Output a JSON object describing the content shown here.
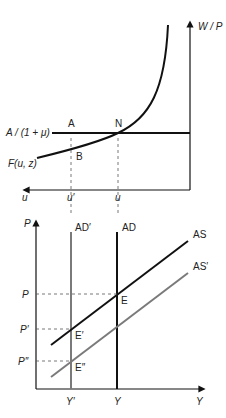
{
  "top_panel": {
    "y_axis_label": "W / P",
    "x_axis_label": "u",
    "price_setting_label": "A / (1 + μ)",
    "wage_setting_label": "F(u, z)",
    "points": {
      "A": "A",
      "N": "N",
      "B": "B"
    },
    "x_ticks": [
      "u′",
      "u"
    ]
  },
  "bottom_panel": {
    "y_axis_label": "P",
    "x_axis_label": "Y",
    "curves": {
      "ad_prime": "AD′",
      "ad": "AD",
      "as": "AS",
      "as_prime": "AS′"
    },
    "points": {
      "E": "E",
      "E_prime": "E′",
      "E_dprime": "E″"
    },
    "y_ticks": [
      "P",
      "P′",
      "P″"
    ],
    "x_ticks": [
      "Y′",
      "Y"
    ]
  },
  "colors": {
    "primary": "#111111",
    "secondary": "#7a7a7a",
    "dashed": "#555555"
  }
}
